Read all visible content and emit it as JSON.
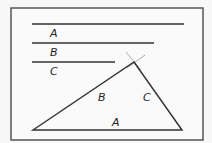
{
  "diagram": {
    "frame": {
      "x": 11,
      "y": 8,
      "width": 192,
      "height": 132,
      "color": "#555555"
    },
    "segments": [
      {
        "label": "A",
        "x1": 32,
        "x2": 184,
        "y": 24,
        "label_x": 50,
        "label_y": 37
      },
      {
        "label": "B",
        "x1": 32,
        "x2": 154,
        "y": 43,
        "label_x": 50,
        "label_y": 56
      },
      {
        "label": "C",
        "x1": 32,
        "x2": 115,
        "y": 62,
        "label_x": 50,
        "label_y": 75
      }
    ],
    "triangle": {
      "vertices": [
        [
          33,
          130
        ],
        [
          134,
          62
        ],
        [
          182,
          130
        ]
      ],
      "side_labels": [
        {
          "label": "A",
          "x": 112,
          "y": 126
        },
        {
          "label": "B",
          "x": 98,
          "y": 101
        },
        {
          "label": "C",
          "x": 143,
          "y": 101
        }
      ]
    },
    "construction_arcs": "intersecting arcs at apex",
    "line_color": "#333333",
    "arc_color": "#aaaaaa"
  }
}
